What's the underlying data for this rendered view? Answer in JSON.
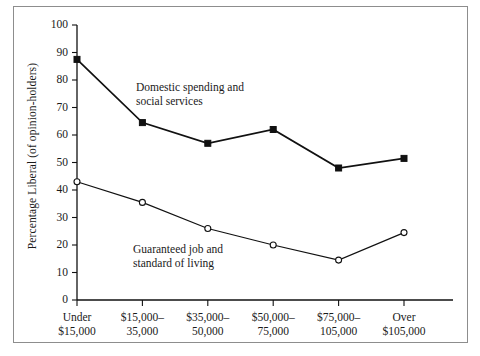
{
  "chart_data": {
    "type": "line",
    "title": "",
    "xlabel": "",
    "ylabel": "Percentage Liberal (of opinion-holders)",
    "categories": [
      "Under $15,000",
      "$15,000–35,000",
      "$35,000–50,000",
      "$50,000–75,000",
      "$75,000–105,000",
      "Over $105,000"
    ],
    "category_lines": [
      [
        "Under",
        "$15,000"
      ],
      [
        "$15,000–",
        "35,000"
      ],
      [
        "$35,000–",
        "50,000"
      ],
      [
        "$50,000–",
        "75,000"
      ],
      [
        "$75,000–",
        "105,000"
      ],
      [
        "Over",
        "$105,000"
      ]
    ],
    "series": [
      {
        "name": "Domestic spending and social services",
        "marker": "filled-square",
        "values": [
          87.5,
          64.5,
          57,
          62,
          48,
          51.5
        ]
      },
      {
        "name": "Guaranteed job and standard of living",
        "marker": "open-circle",
        "values": [
          43,
          35.5,
          26,
          20,
          14.5,
          24.5
        ]
      }
    ],
    "ylim": [
      0,
      100
    ],
    "ytick_values": [
      0,
      10,
      20,
      30,
      40,
      50,
      60,
      70,
      80,
      90,
      100
    ],
    "ytick_labels": [
      "0",
      "10",
      "20",
      "30",
      "40",
      "50",
      "60",
      "70",
      "80",
      "90",
      "100"
    ],
    "grid": false,
    "legend": "annotations-inline",
    "annotations": [
      {
        "id": "domestic",
        "lines": [
          "Domestic spending and",
          "social services"
        ]
      },
      {
        "id": "guaranteed",
        "lines": [
          "Guaranteed job and",
          "standard of living"
        ]
      }
    ],
    "colors": {
      "line": "#111111",
      "axis": "#111111",
      "border": "#8d8d8d",
      "background": "#ffffff",
      "text": "#1a1a1a"
    }
  }
}
